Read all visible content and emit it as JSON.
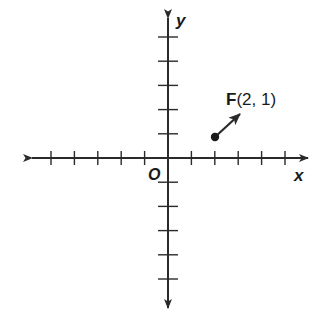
{
  "diagram": {
    "type": "coordinate-plane",
    "axes": {
      "x_label": "x",
      "y_label": "y",
      "origin_label": "O",
      "x_ticks": [
        -5,
        -4,
        -3,
        -2,
        -1,
        1,
        2,
        3,
        4,
        5
      ],
      "y_ticks": [
        -5,
        -4,
        -3,
        -2,
        -1,
        1,
        2,
        3,
        4,
        5
      ],
      "arrows_both_ends": true
    },
    "points": [
      {
        "name": "F",
        "x": 2,
        "y": 1,
        "label_name": "F",
        "label_coords": "(2, 1)",
        "has_arrow": true,
        "arrow_direction": "up-right"
      }
    ],
    "colors": {
      "axis": "#2a2a2a",
      "text": "#1a1a1a",
      "background": "#ffffff"
    }
  }
}
